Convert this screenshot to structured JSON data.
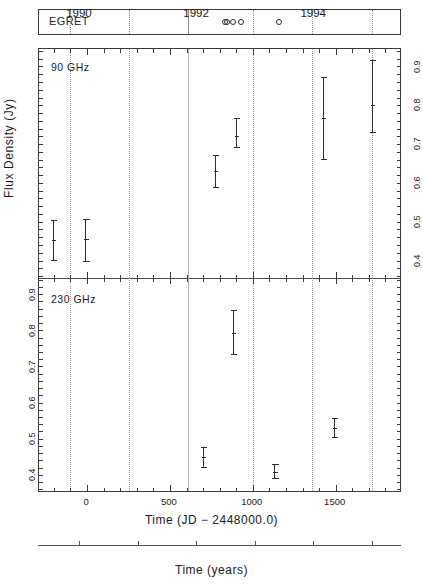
{
  "figure": {
    "ylabel": "Flux Density (Jy)",
    "xlabel_primary": "Time (JD  −  2448000.0)",
    "xlabel_secondary": "Time (years)"
  },
  "egret": {
    "label": "EGRET",
    "dividers_jd": [
      -100,
      250,
      610,
      1000,
      1355,
      1720
    ],
    "divider_styles": [
      "dotted",
      "dotted",
      "solid",
      "dotted",
      "dotted",
      "dotted"
    ],
    "detections_jd": [
      830,
      845,
      880,
      930,
      1160
    ],
    "marker": "open-circle"
  },
  "axes": {
    "x_range": [
      -290,
      1900
    ],
    "x_ticks_major": [
      0,
      500,
      1000,
      1500
    ],
    "x_tick_labels": [
      "0",
      "500",
      "1000",
      "1500"
    ],
    "x_ticks_minor_step": 100,
    "gridlines_jd": [
      -100,
      250,
      610,
      1000,
      1355,
      1720
    ],
    "gridline_styles": [
      "dotted",
      "dotted",
      "solid",
      "dotted",
      "dotted",
      "dotted"
    ],
    "year_ticks": [
      1990,
      1992,
      1994
    ],
    "year_tick_labels": [
      "1990",
      "1992",
      "1994"
    ],
    "year_minor_ticks": [
      1991,
      1993,
      1995
    ],
    "year_range": [
      1989.3,
      1995.5
    ]
  },
  "chart_data": {
    "type": "scatter",
    "title": "",
    "xlabel": "Time (JD − 2448000.0)",
    "ylabel": "Flux Density (Jy)",
    "xlim": [
      -290,
      1900
    ],
    "grid": true,
    "legend": "none",
    "panels": [
      {
        "name": "90 GHz",
        "label": "90 GHz",
        "ylim": [
          0.345,
          0.935
        ],
        "y_ticks": [
          0.4,
          0.5,
          0.6,
          0.7,
          0.8,
          0.9
        ],
        "y_tick_labels": [
          "0.4",
          "0.5",
          "0.6",
          "0.7",
          "0.8",
          "0.9"
        ],
        "y_axis_side": "right",
        "points": [
          {
            "x": -205,
            "y": 0.442,
            "yerr_low": 0.39,
            "yerr_high": 0.495
          },
          {
            "x": -10,
            "y": 0.445,
            "yerr_low": 0.386,
            "yerr_high": 0.497
          },
          {
            "x": 770,
            "y": 0.621,
            "yerr_low": 0.578,
            "yerr_high": 0.663
          },
          {
            "x": 900,
            "y": 0.712,
            "yerr_low": 0.68,
            "yerr_high": 0.757
          },
          {
            "x": 1425,
            "y": 0.757,
            "yerr_low": 0.648,
            "yerr_high": 0.862
          },
          {
            "x": 1720,
            "y": 0.79,
            "yerr_low": 0.719,
            "yerr_high": 0.907
          }
        ]
      },
      {
        "name": "230 GHz",
        "label": "230 GHz",
        "ylim": [
          0.345,
          0.935
        ],
        "y_ticks": [
          0.4,
          0.5,
          0.6,
          0.7,
          0.8,
          0.9
        ],
        "y_tick_labels": [
          "0.4",
          "0.5",
          "0.6",
          "0.7",
          "0.8",
          "0.9"
        ],
        "y_axis_side": "left",
        "points": [
          {
            "x": 700,
            "y": 0.438,
            "yerr_low": 0.408,
            "yerr_high": 0.468
          },
          {
            "x": 880,
            "y": 0.783,
            "yerr_low": 0.722,
            "yerr_high": 0.845
          },
          {
            "x": 1130,
            "y": 0.398,
            "yerr_low": 0.377,
            "yerr_high": 0.419
          },
          {
            "x": 1490,
            "y": 0.519,
            "yerr_low": 0.492,
            "yerr_high": 0.546
          }
        ]
      }
    ]
  }
}
